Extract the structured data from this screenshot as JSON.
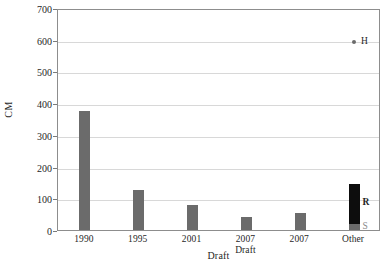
{
  "chart_data": {
    "type": "bar",
    "title": "",
    "subtitle": "",
    "xlabel": "Draft",
    "ylabel": "CM",
    "ylim": [
      0,
      700
    ],
    "yticks": [
      0,
      100,
      200,
      300,
      400,
      500,
      600,
      700
    ],
    "ytick_labels": [
      "0",
      "100",
      "200",
      "300",
      "400",
      "500",
      "600",
      "700"
    ],
    "grid": "horizontal",
    "legend": "none",
    "categories": [
      "1990",
      "1995",
      "2001",
      "2007 Draft",
      "2007",
      "Other"
    ],
    "category_label_lines": [
      [
        "1990"
      ],
      [
        "1995"
      ],
      [
        "2001"
      ],
      [
        "2007",
        "Draft"
      ],
      [
        "2007"
      ],
      [
        "Other"
      ]
    ],
    "series": [
      {
        "name": "S",
        "color": "#6b6b6b",
        "values": [
          375,
          125,
          78,
          42,
          55,
          18
        ]
      },
      {
        "name": "R",
        "color": "#0d0d0d",
        "values": [
          0,
          0,
          0,
          0,
          0,
          127
        ]
      }
    ],
    "stacked": true,
    "annotations": [
      {
        "name": "R",
        "text": "R",
        "category": "Other",
        "value": 95,
        "style": "bold"
      },
      {
        "name": "S",
        "text": "S",
        "category": "Other",
        "value": 18,
        "style": "muted"
      }
    ],
    "scatter_points": [
      {
        "label": "H",
        "category": "Other",
        "value": 600,
        "color": "#6b6b6b"
      }
    ]
  },
  "colors": {
    "bar_gray": "#6b6b6b",
    "bar_black": "#0d0d0d",
    "gridline": "#d8d8d8",
    "axis": "#8d8d8d",
    "text": "#1f1f1f",
    "background": "#ffffff"
  }
}
